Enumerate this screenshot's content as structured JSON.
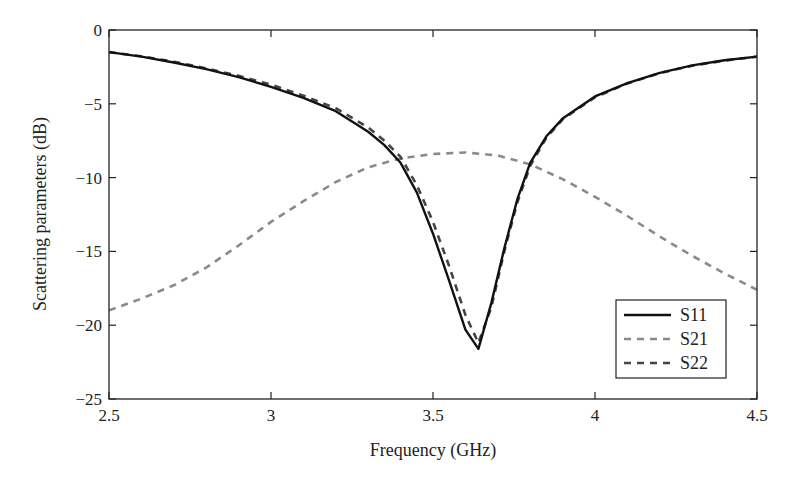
{
  "chart_data": {
    "type": "line",
    "title": "",
    "xlabel": "Frequency (GHz)",
    "ylabel": "Scattering parameters (dB)",
    "xlim": [
      2.5,
      4.5
    ],
    "ylim": [
      -25,
      0
    ],
    "xticks": [
      2.5,
      3,
      3.5,
      4,
      4.5
    ],
    "xtick_labels": [
      "2.5",
      "3",
      "3.5",
      "4",
      "4.5"
    ],
    "yticks": [
      0,
      -5,
      -10,
      -15,
      -20,
      -25
    ],
    "ytick_labels": [
      "0",
      "−5",
      "−10",
      "−15",
      "−20",
      "−25"
    ],
    "grid": false,
    "legend_position": "lower right",
    "series": [
      {
        "name": "S11",
        "style": "solid",
        "color": "#111111",
        "x": [
          2.5,
          2.6,
          2.7,
          2.8,
          2.9,
          3.0,
          3.1,
          3.2,
          3.3,
          3.35,
          3.4,
          3.45,
          3.5,
          3.55,
          3.6,
          3.64,
          3.68,
          3.72,
          3.76,
          3.8,
          3.85,
          3.9,
          4.0,
          4.1,
          4.2,
          4.3,
          4.4,
          4.5
        ],
        "y": [
          -1.5,
          -1.8,
          -2.2,
          -2.65,
          -3.2,
          -3.85,
          -4.6,
          -5.5,
          -6.9,
          -7.8,
          -9.0,
          -11.0,
          -13.8,
          -17.0,
          -20.3,
          -21.6,
          -18.5,
          -14.8,
          -11.5,
          -9.0,
          -7.2,
          -6.0,
          -4.5,
          -3.6,
          -2.9,
          -2.4,
          -2.05,
          -1.8
        ]
      },
      {
        "name": "S21",
        "style": "dashed",
        "color": "#8a8a8a",
        "x": [
          2.5,
          2.6,
          2.7,
          2.8,
          2.9,
          3.0,
          3.1,
          3.2,
          3.3,
          3.4,
          3.5,
          3.6,
          3.7,
          3.8,
          3.9,
          4.0,
          4.1,
          4.2,
          4.3,
          4.4,
          4.5
        ],
        "y": [
          -19.0,
          -18.2,
          -17.3,
          -16.1,
          -14.6,
          -13.0,
          -11.6,
          -10.3,
          -9.3,
          -8.7,
          -8.4,
          -8.3,
          -8.5,
          -9.1,
          -10.1,
          -11.3,
          -12.6,
          -14.0,
          -15.3,
          -16.5,
          -17.6
        ]
      },
      {
        "name": "S22",
        "style": "dashed",
        "color": "#444444",
        "x": [
          2.5,
          2.6,
          2.7,
          2.8,
          2.9,
          3.0,
          3.1,
          3.2,
          3.3,
          3.35,
          3.4,
          3.45,
          3.5,
          3.55,
          3.6,
          3.64,
          3.68,
          3.72,
          3.76,
          3.8,
          3.85,
          3.9,
          4.0,
          4.1,
          4.2,
          4.3,
          4.4,
          4.5
        ],
        "y": [
          -1.5,
          -1.78,
          -2.15,
          -2.6,
          -3.1,
          -3.7,
          -4.45,
          -5.3,
          -6.6,
          -7.5,
          -8.6,
          -10.5,
          -13.0,
          -16.0,
          -19.3,
          -21.2,
          -18.8,
          -15.0,
          -11.7,
          -9.2,
          -7.3,
          -6.05,
          -4.55,
          -3.62,
          -2.92,
          -2.42,
          -2.07,
          -1.8
        ]
      }
    ]
  },
  "legend": {
    "items": [
      "S11",
      "S21",
      "S22"
    ]
  }
}
